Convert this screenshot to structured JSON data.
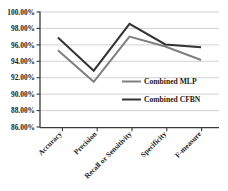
{
  "chart_data": {
    "type": "line",
    "title": "",
    "subtitle": "",
    "xlabel": "",
    "ylabel": "",
    "categories": [
      "Accuracy",
      "Precision",
      "Recall or Sensitivity",
      "Specificity",
      "F-measure"
    ],
    "series": [
      {
        "name": "Combined MLP",
        "color": "#7f7f7f",
        "values": [
          95.35,
          91.5,
          97.0,
          95.8,
          94.15
        ]
      },
      {
        "name": "Combined CFBN",
        "color": "#333333",
        "values": [
          96.9,
          92.85,
          98.55,
          96.05,
          95.7
        ]
      }
    ],
    "ylim": [
      86.0,
      100.0
    ],
    "ytick_values": [
      86.0,
      88.0,
      90.0,
      92.0,
      94.0,
      96.0,
      98.0,
      100.0
    ],
    "ytick_labels": [
      "86.00%",
      "88.00%",
      "90.00%",
      "92.00%",
      "94.00%",
      "96.00%",
      "98.00%",
      "100.00%"
    ],
    "grid": true,
    "grid_axis": "y",
    "legend_position": "center-right",
    "xtick_rotation": 45
  },
  "legend": {
    "entries": [
      {
        "label": "Combined MLP",
        "color": "#7f7f7f"
      },
      {
        "label": "Combined CFBN",
        "color": "#333333"
      }
    ]
  },
  "colors": {
    "background": "#ffffff",
    "gridline": "#bfbfbf",
    "axis": "#3a3a3a",
    "text": "#1a1a1a"
  }
}
